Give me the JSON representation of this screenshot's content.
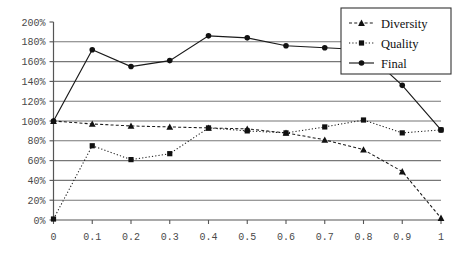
{
  "chart_data": {
    "type": "line",
    "title": "",
    "xlabel": "",
    "ylabel": "",
    "xlim": [
      0,
      1
    ],
    "ylim": [
      0,
      200
    ],
    "grid": true,
    "legend_position": "top-right",
    "x": [
      0,
      0.1,
      0.2,
      0.3,
      0.4,
      0.5,
      0.6,
      0.7,
      0.8,
      0.9,
      1
    ],
    "xtick_labels": [
      "0",
      "0.1",
      "0.2",
      "0.3",
      "0.4",
      "0.5",
      "0.6",
      "0.7",
      "0.8",
      "0.9",
      "1"
    ],
    "ytick_values": [
      0,
      20,
      40,
      60,
      80,
      100,
      120,
      140,
      160,
      180,
      200
    ],
    "ytick_labels": [
      "0%",
      "20%",
      "40%",
      "60%",
      "80%",
      "100%",
      "120%",
      "140%",
      "160%",
      "180%",
      "200%"
    ],
    "series": [
      {
        "name": "Diversity",
        "marker": "triangle",
        "linestyle": "dashed",
        "values": [
          100,
          97,
          95,
          94,
          93,
          92,
          88,
          81,
          71,
          49,
          2
        ]
      },
      {
        "name": "Quality",
        "marker": "square",
        "linestyle": "dotted",
        "values": [
          1,
          75,
          61,
          67,
          93,
          90,
          88,
          94,
          101,
          88,
          91
        ]
      },
      {
        "name": "Final",
        "marker": "circle",
        "linestyle": "solid",
        "values": [
          100,
          172,
          155,
          161,
          186,
          184,
          176,
          174,
          172,
          136,
          91
        ]
      }
    ]
  }
}
